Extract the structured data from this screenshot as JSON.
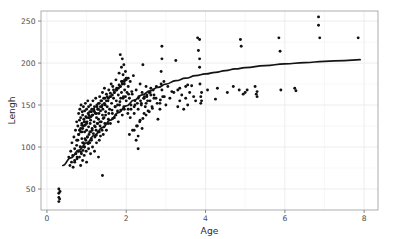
{
  "chart_data": {
    "type": "scatter",
    "title": "",
    "xlabel": "Age",
    "ylabel": "Lengh",
    "xlim": [
      -0.15,
      8.35
    ],
    "ylim": [
      25,
      262
    ],
    "xticks": [
      0,
      2,
      4,
      6,
      8
    ],
    "xtick_labels": [
      "0",
      "2",
      "4",
      "6",
      "8"
    ],
    "yticks": [
      50,
      100,
      150,
      200,
      250
    ],
    "ytick_labels": [
      "50",
      "100",
      "150",
      "200",
      "250"
    ],
    "x_minor_ticks": [
      1,
      3,
      5,
      7
    ],
    "y_minor_ticks": [
      75,
      125,
      175,
      225
    ],
    "grid": true,
    "legend": "none",
    "point_color": "#101010",
    "point_size": 1.45,
    "line_color": "#141414",
    "panel_background": "#ffffff",
    "grid_color": "#e8e8e8",
    "series": [
      {
        "name": "observations",
        "type": "scatter",
        "x": [
          0.3,
          0.3,
          0.3,
          0.3,
          0.32,
          0.33,
          0.55,
          0.58,
          0.6,
          0.62,
          0.63,
          0.65,
          0.66,
          0.68,
          0.7,
          0.7,
          0.72,
          0.73,
          0.75,
          0.75,
          0.76,
          0.78,
          0.78,
          0.8,
          0.8,
          0.8,
          0.82,
          0.82,
          0.83,
          0.84,
          0.85,
          0.85,
          0.85,
          0.86,
          0.87,
          0.88,
          0.88,
          0.89,
          0.9,
          0.9,
          0.9,
          0.91,
          0.92,
          0.92,
          0.93,
          0.94,
          0.95,
          0.95,
          0.95,
          0.96,
          0.97,
          0.98,
          0.98,
          0.99,
          1.0,
          1.0,
          1.0,
          1.01,
          1.02,
          1.03,
          1.04,
          1.05,
          1.05,
          1.05,
          1.06,
          1.07,
          1.08,
          1.08,
          1.09,
          1.1,
          1.1,
          1.1,
          1.11,
          1.12,
          1.13,
          1.14,
          1.15,
          1.15,
          1.16,
          1.17,
          1.18,
          1.19,
          1.2,
          1.2,
          1.2,
          1.21,
          1.22,
          1.23,
          1.24,
          1.25,
          1.25,
          1.26,
          1.27,
          1.28,
          1.29,
          1.3,
          1.3,
          1.3,
          1.31,
          1.32,
          1.33,
          1.34,
          1.35,
          1.35,
          1.36,
          1.37,
          1.38,
          1.39,
          1.4,
          1.4,
          1.4,
          1.41,
          1.42,
          1.43,
          1.44,
          1.45,
          1.46,
          1.47,
          1.48,
          1.5,
          1.5,
          1.52,
          1.54,
          1.55,
          1.56,
          1.58,
          1.6,
          1.6,
          1.62,
          1.63,
          1.65,
          1.66,
          1.68,
          1.7,
          1.7,
          1.72,
          1.74,
          1.75,
          1.76,
          1.78,
          1.8,
          1.8,
          1.82,
          1.83,
          1.85,
          1.85,
          1.86,
          1.88,
          1.88,
          1.9,
          1.9,
          1.9,
          1.92,
          1.93,
          1.94,
          1.95,
          1.95,
          1.96,
          1.98,
          2.0,
          2.0,
          2.02,
          2.05,
          2.05,
          2.08,
          2.1,
          2.1,
          2.12,
          2.15,
          2.18,
          2.2,
          2.2,
          2.22,
          2.25,
          2.25,
          2.28,
          2.3,
          2.3,
          2.3,
          2.32,
          2.35,
          2.35,
          2.38,
          2.4,
          2.4,
          2.42,
          2.45,
          2.45,
          2.48,
          2.5,
          2.5,
          2.52,
          2.55,
          2.58,
          2.6,
          2.62,
          2.65,
          2.7,
          2.75,
          2.8,
          2.85,
          2.85,
          2.88,
          2.88,
          2.9,
          2.9,
          2.9,
          2.92,
          2.95,
          3.0,
          3.05,
          3.1,
          3.2,
          3.25,
          3.3,
          3.3,
          3.35,
          3.4,
          3.45,
          3.5,
          3.5,
          3.55,
          3.6,
          3.65,
          3.7,
          3.75,
          3.8,
          3.82,
          3.85,
          3.85,
          3.85,
          3.86,
          3.88,
          3.88,
          3.9,
          3.9,
          4.05,
          4.25,
          4.3,
          4.55,
          4.7,
          4.85,
          4.88,
          4.9,
          4.95,
          5.0,
          5.05,
          5.25,
          5.28,
          5.3,
          5.3,
          5.85,
          5.88,
          5.9,
          6.25,
          6.28,
          6.85,
          6.85,
          6.88,
          7.85,
          0.75,
          0.8,
          0.85,
          0.88,
          0.92,
          0.95,
          1.0,
          1.05,
          1.1,
          1.15,
          1.2,
          1.25,
          1.3,
          1.35,
          1.4,
          1.45,
          1.5,
          1.55,
          1.6,
          1.65,
          1.7,
          1.75,
          1.8,
          1.85,
          1.9,
          1.95,
          2.0,
          2.05,
          0.78,
          0.84,
          0.9,
          0.96,
          1.02,
          1.08,
          1.14,
          1.22,
          1.28,
          1.34,
          1.42,
          1.48,
          1.56,
          1.64,
          1.72,
          1.78,
          1.84,
          1.92,
          1.98,
          2.06,
          2.14,
          2.22,
          2.3,
          2.38,
          2.46,
          2.54,
          2.62,
          2.7,
          0.82,
          0.88,
          0.94,
          1.0,
          1.06,
          1.12,
          1.18,
          1.26,
          1.32,
          1.38,
          1.46,
          1.52,
          1.6,
          1.68,
          1.76,
          1.82,
          1.88,
          1.96,
          2.04,
          2.12,
          2.2,
          2.28,
          2.36,
          2.44,
          2.52,
          2.6,
          2.68,
          2.76,
          0.7,
          0.76,
          0.86,
          0.94,
          1.04,
          1.12,
          1.24,
          1.32,
          1.44,
          1.54,
          1.66,
          1.74,
          1.86,
          1.94,
          2.08,
          2.16,
          2.26,
          2.34,
          2.42,
          2.5,
          2.58,
          2.66,
          2.78,
          2.86,
          2.96,
          3.15,
          3.35,
          3.55
        ],
        "y": [
          35,
          40,
          45,
          50,
          38,
          47,
          88,
          78,
          95,
          82,
          105,
          90,
          76,
          112,
          98,
          84,
          120,
          92,
          130,
          102,
          86,
          125,
          108,
          140,
          95,
          115,
          132,
          88,
          145,
          100,
          118,
          135,
          78,
          150,
          92,
          128,
          110,
          142,
          84,
          122,
          138,
          96,
          148,
          105,
          133,
          90,
          118,
          143,
          100,
          126,
          152,
          108,
          136,
          95,
          120,
          145,
          82,
          130,
          112,
          155,
          140,
          98,
          124,
          148,
          115,
          135,
          105,
          142,
          128,
          92,
          118,
          150,
          136,
          110,
          145,
          122,
          100,
          138,
          155,
          116,
          143,
          130,
          95,
          125,
          148,
          112,
          140,
          158,
          120,
          135,
          105,
          150,
          128,
          145,
          118,
          88,
          133,
          152,
          140,
          108,
          160,
          125,
          113,
          143,
          155,
          130,
          148,
          120,
          66,
          138,
          165,
          145,
          115,
          158,
          135,
          170,
          128,
          150,
          142,
          120,
          163,
          148,
          155,
          133,
          168,
          145,
          128,
          160,
          175,
          152,
          140,
          172,
          158,
          135,
          165,
          148,
          180,
          155,
          168,
          143,
          130,
          162,
          188,
          150,
          210,
          172,
          158,
          195,
          165,
          138,
          178,
          205,
          186,
          160,
          198,
          145,
          175,
          168,
          190,
          155,
          182,
          165,
          145,
          172,
          158,
          135,
          178,
          150,
          163,
          185,
          120,
          140,
          155,
          108,
          168,
          125,
          98,
          113,
          145,
          160,
          132,
          175,
          150,
          122,
          165,
          198,
          140,
          158,
          148,
          152,
          172,
          160,
          143,
          165,
          155,
          170,
          148,
          162,
          158,
          133,
          145,
          152,
          175,
          190,
          205,
          168,
          220,
          160,
          178,
          150,
          172,
          158,
          165,
          203,
          148,
          168,
          155,
          162,
          145,
          172,
          158,
          150,
          165,
          173,
          160,
          155,
          230,
          215,
          228,
          205,
          195,
          175,
          152,
          160,
          165,
          155,
          168,
          157,
          170,
          165,
          172,
          168,
          228,
          220,
          163,
          165,
          168,
          172,
          163,
          160,
          166,
          230,
          214,
          168,
          170,
          167,
          255,
          245,
          230,
          230,
          108,
          115,
          122,
          118,
          125,
          130,
          128,
          135,
          132,
          138,
          142,
          140,
          145,
          148,
          150,
          152,
          155,
          158,
          160,
          162,
          165,
          168,
          170,
          172,
          175,
          178,
          180,
          182,
          95,
          100,
          105,
          110,
          112,
          118,
          120,
          124,
          128,
          130,
          134,
          138,
          140,
          144,
          148,
          150,
          154,
          158,
          160,
          163,
          166,
          150,
          158,
          152,
          160,
          155,
          162,
          158,
          120,
          126,
          130,
          135,
          138,
          142,
          145,
          148,
          152,
          155,
          158,
          160,
          164,
          168,
          170,
          174,
          178,
          180,
          140,
          145,
          148,
          152,
          155,
          158,
          162,
          165,
          168,
          172,
          82,
          88,
          94,
          100,
          104,
          108,
          114,
          118,
          124,
          128,
          134,
          138,
          144,
          148,
          115,
          120,
          125,
          130,
          134,
          138,
          142,
          146,
          152,
          156,
          160,
          166,
          170,
          174
        ]
      },
      {
        "name": "loess-smooth",
        "type": "line",
        "x": [
          0.4,
          0.6,
          0.8,
          1.0,
          1.2,
          1.4,
          1.6,
          1.8,
          2.0,
          2.2,
          2.4,
          2.6,
          2.8,
          3.0,
          3.25,
          3.5,
          3.75,
          4.0,
          4.25,
          4.5,
          4.75,
          5.0,
          5.5,
          6.0,
          6.5,
          7.0,
          7.5,
          7.9
        ],
        "y": [
          78,
          87,
          96,
          105,
          114,
          123,
          132,
          141,
          149,
          156,
          162,
          167,
          171,
          175,
          179,
          182,
          185,
          187,
          189,
          191,
          193,
          194.5,
          197,
          199,
          200.5,
          202,
          203,
          204
        ]
      }
    ]
  }
}
